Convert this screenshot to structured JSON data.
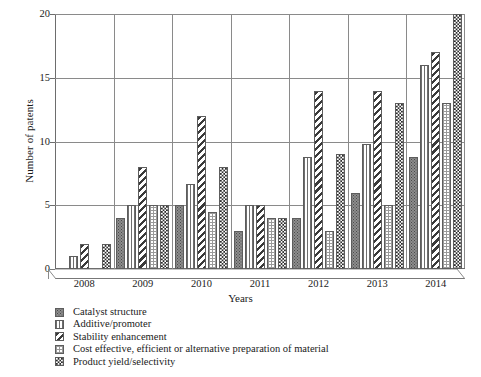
{
  "chart_data": {
    "type": "bar",
    "title": "",
    "xlabel": "Years",
    "ylabel": "Number of patents",
    "categories": [
      "2008",
      "2009",
      "2010",
      "2011",
      "2012",
      "2013",
      "2014"
    ],
    "ylim": [
      0,
      20
    ],
    "yticks": [
      "0",
      "5",
      "10",
      "15",
      "20"
    ],
    "ytick_values": [
      0,
      5,
      10,
      15,
      20
    ],
    "grid": "horizontal-and-vertical",
    "legend_position": "below-plot-left",
    "series": [
      {
        "name": "Catalyst structure",
        "pattern": "dark-dotted",
        "values": [
          0,
          4,
          5,
          3,
          4,
          6,
          8.8
        ]
      },
      {
        "name": "Additive/promoter",
        "pattern": "vertical-lines",
        "values": [
          1,
          5,
          6.7,
          5,
          8.8,
          9.8,
          16
        ]
      },
      {
        "name": "Stability enhancement",
        "pattern": "diagonal-hatch",
        "values": [
          2,
          8,
          12,
          5,
          14,
          14,
          17
        ]
      },
      {
        "name": "Cost effective, efficient or alternative preparation of material",
        "pattern": "light-grid-dots",
        "values": [
          0,
          5,
          4.5,
          4,
          3,
          5,
          13
        ]
      },
      {
        "name": "Product yield/selectivity",
        "pattern": "dark-checker",
        "values": [
          2,
          5,
          8,
          4,
          9,
          13,
          20
        ]
      }
    ]
  }
}
